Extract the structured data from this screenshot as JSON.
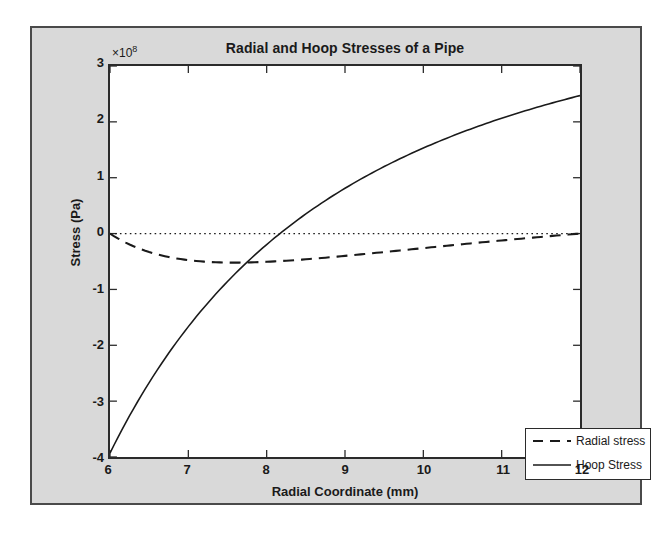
{
  "figure": {
    "background_color": "#d9d9d9",
    "plot_background_color": "#ffffff",
    "border_color": "#4a4a4a"
  },
  "chart_data": {
    "type": "line",
    "title": "Radial and Hoop Stresses of a Pipe",
    "xlabel": "Radial Coordinate (mm)",
    "ylabel": "Stress (Pa)",
    "y_exponent_label": "×10",
    "y_exponent_power": "8",
    "y_exponent_multiplier": 100000000,
    "xlim": [
      6,
      12
    ],
    "ylim": [
      -4,
      3
    ],
    "xticks": [
      6,
      7,
      8,
      9,
      10,
      11,
      12
    ],
    "yticks": [
      3,
      2,
      1,
      0,
      -1,
      -2,
      -3,
      -4
    ],
    "xtick_labels": [
      "6",
      "7",
      "8",
      "9",
      "10",
      "11",
      "12"
    ],
    "ytick_labels": [
      "3",
      "2",
      "1",
      "0",
      "-1",
      "-2",
      "-3",
      "-4"
    ],
    "grid": false,
    "zero_reference_line": {
      "value": 0,
      "style": "dotted",
      "color": "#1a1a1a"
    },
    "legend": {
      "position": "lower right",
      "entries": [
        {
          "label": "Radial stress",
          "style": "dashed",
          "color": "#1a1a1a"
        },
        {
          "label": "Hoop Stress",
          "style": "solid",
          "color": "#1a1a1a"
        }
      ]
    },
    "x": [
      6.0,
      6.2,
      6.4,
      6.6,
      6.8,
      7.0,
      7.2,
      7.4,
      7.6,
      7.8,
      8.0,
      8.2,
      8.4,
      8.6,
      8.8,
      9.0,
      9.2,
      9.4,
      9.6,
      9.8,
      10.0,
      10.2,
      10.4,
      10.6,
      10.8,
      11.0,
      11.2,
      11.4,
      11.6,
      11.8,
      12.0
    ],
    "series": [
      {
        "name": "Radial stress",
        "style": "dashed",
        "color": "#1a1a1a",
        "units": "Pa",
        "scale": 100000000,
        "values": [
          0.0,
          -0.17,
          -0.29,
          -0.38,
          -0.44,
          -0.48,
          -0.51,
          -0.52,
          -0.53,
          -0.53,
          -0.52,
          -0.51,
          -0.5,
          -0.48,
          -0.46,
          -0.44,
          -0.41,
          -0.38,
          -0.35,
          -0.32,
          -0.29,
          -0.26,
          -0.23,
          -0.2,
          -0.17,
          -0.14,
          -0.11,
          -0.08,
          -0.05,
          -0.02,
          0.0
        ]
      },
      {
        "name": "Hoop Stress",
        "style": "solid",
        "color": "#1a1a1a",
        "units": "Pa",
        "scale": 100000000,
        "values": [
          -3.93,
          -3.53,
          -3.17,
          -2.84,
          -2.55,
          -2.28,
          -2.04,
          -1.81,
          -1.6,
          -1.41,
          -1.23,
          -1.06,
          -0.9,
          -0.76,
          -0.62,
          -0.49,
          -0.36,
          -0.24,
          -0.13,
          -0.02,
          0.08,
          0.18,
          0.27,
          0.36,
          0.45,
          0.53,
          0.61,
          0.69,
          0.76,
          0.83,
          0.9
        ]
      }
    ],
    "series_display_note": {
      "hoop_endpoints": {
        "start_x": 6,
        "start_y": -3.93,
        "end_x": 12,
        "end_y": 2.47,
        "zero_crossing_x": 8.82
      },
      "radial_endpoints": {
        "start_x": 6,
        "start_y": 0.0,
        "min_x": 7.75,
        "min_y": -0.52,
        "end_x": 12,
        "end_y": 0.0
      }
    }
  }
}
